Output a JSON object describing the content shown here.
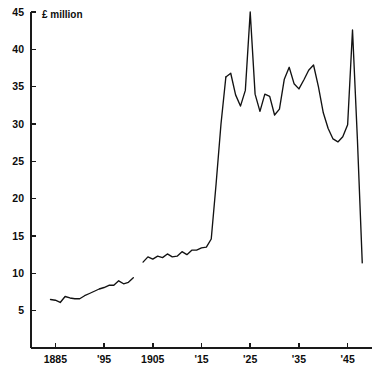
{
  "chart_data": {
    "type": "line",
    "title": "",
    "subtitle": "",
    "xlabel": "",
    "ylabel": "£ million",
    "unit_label": "£ million",
    "xlim": [
      1880,
      1950
    ],
    "ylim": [
      0,
      45
    ],
    "grid": false,
    "legend": false,
    "legend_position": "none",
    "y_ticks": [
      5,
      10,
      15,
      20,
      25,
      30,
      35,
      40,
      45
    ],
    "y_tick_labels": [
      "5",
      "10",
      "15",
      "20",
      "25",
      "30",
      "35",
      "40",
      "45"
    ],
    "x_ticks": [
      1885,
      1895,
      1905,
      1915,
      1925,
      1935,
      1945
    ],
    "x_tick_labels": [
      "1885",
      "'95",
      "1905",
      "'15",
      "'25",
      "'35",
      "'45"
    ],
    "line_color": "#121212",
    "axis_color": "#1a1a1a",
    "background_color": "#ffffff",
    "series": [
      {
        "name": "segment-1",
        "x": [
          1884,
          1885,
          1886,
          1887,
          1888,
          1889,
          1890,
          1891,
          1892,
          1893,
          1894,
          1895,
          1896,
          1897,
          1898,
          1899,
          1900,
          1901
        ],
        "values": [
          6.5,
          6.4,
          6.1,
          6.9,
          6.7,
          6.6,
          6.6,
          7.0,
          7.3,
          7.6,
          7.9,
          8.1,
          8.4,
          8.4,
          9.0,
          8.6,
          8.8,
          9.4
        ]
      },
      {
        "name": "segment-2",
        "x": [
          1903,
          1904,
          1905,
          1906,
          1907,
          1908,
          1909,
          1910,
          1911,
          1912,
          1913,
          1914,
          1915,
          1916,
          1917,
          1918,
          1919,
          1920
        ],
        "values": [
          11.5,
          12.2,
          11.9,
          12.3,
          12.1,
          12.6,
          12.2,
          12.3,
          12.9,
          12.5,
          13.1,
          13.1,
          13.4,
          13.5,
          14.6,
          22.0,
          30.0,
          36.3
        ]
      },
      {
        "name": "segment-3",
        "x": [
          1920,
          1921,
          1922,
          1923,
          1924,
          1925,
          1926,
          1927,
          1928,
          1929,
          1930,
          1931,
          1932,
          1933,
          1934,
          1935,
          1936,
          1937,
          1938,
          1939,
          1940,
          1941,
          1942,
          1943,
          1944,
          1945,
          1946,
          1947,
          1948
        ],
        "values": [
          36.3,
          36.8,
          33.9,
          32.4,
          34.5,
          45.0,
          34.0,
          31.7,
          34.0,
          33.7,
          31.2,
          32.0,
          36.0,
          37.6,
          35.4,
          34.7,
          35.9,
          37.2,
          37.9,
          35.0,
          31.5,
          29.4,
          28.0,
          27.6,
          28.3,
          29.9,
          42.6,
          28.0,
          11.4
        ]
      }
    ],
    "annotations": [
      {
        "text": "£ million",
        "position": "top-left-inside-axis"
      }
    ]
  },
  "geometry": {
    "plot_left_px": 31,
    "plot_top_px": 12,
    "plot_bottom_px": 348,
    "plot_right_px": 372,
    "y_axis_top_value": 45,
    "y_axis_bottom_value": 0
  }
}
